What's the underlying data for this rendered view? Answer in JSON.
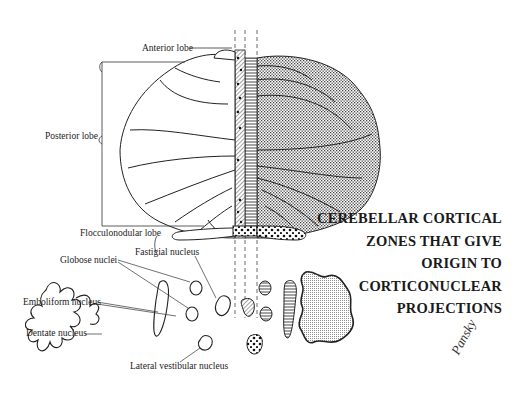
{
  "figure": {
    "title_lines": [
      "CEREBELLAR CORTICAL",
      "ZONES THAT GIVE",
      "ORIGIN TO",
      "CORTICONUCLEAR",
      "PROJECTIONS"
    ],
    "signature": "Pansky"
  },
  "cerebellum_labels": {
    "anterior_lobe": "Anterior lobe",
    "posterior_lobe": "Posterior lobe",
    "flocculonodular_lobe": "Flocculonodular lobe"
  },
  "nuclei_labels": {
    "fastigial": "Fastigial nucleus",
    "globose": "Globose nuclei",
    "emboliform": "Emboliform nucleus",
    "dentate": "Dentate nucleus",
    "lateral_vestibular": "Lateral vestibular nucleus"
  },
  "zones": [
    {
      "name": "vermis-medial",
      "pattern": "dots-on-hatch",
      "projects_to": "Lateral vestibular nucleus"
    },
    {
      "name": "vermis",
      "pattern": "diagonal-hatch",
      "projects_to": "Fastigial nucleus"
    },
    {
      "name": "intermediate",
      "pattern": "horizontal-lines",
      "projects_to": "Globose and Emboliform nuclei"
    },
    {
      "name": "lateral",
      "pattern": "stipple",
      "projects_to": "Dentate nucleus"
    }
  ]
}
